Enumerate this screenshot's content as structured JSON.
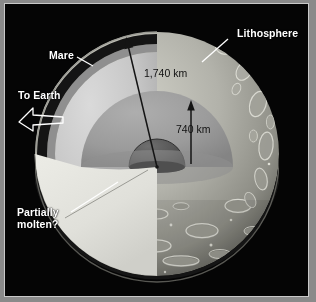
{
  "figure": {
    "background_color": "#050505",
    "frame_color": "#c9c9c9",
    "mount_color": "#8a8a8a"
  },
  "callouts": [
    {
      "id": "lithosphere",
      "label": "Lithosphere",
      "color": "#ffffff",
      "leader": "line-down-left"
    },
    {
      "id": "mare",
      "label": "Mare",
      "color": "#ffffff",
      "leader": "line-down-right"
    },
    {
      "id": "to-earth",
      "label": "To Earth",
      "color": "#ffffff",
      "leader": "hollow-arrow-up-left"
    },
    {
      "id": "partially-molten",
      "label": "Partially\nmolten?",
      "color": "#ffffff",
      "leader": "line-up-right"
    }
  ],
  "dimensions": [
    {
      "id": "outer-radius",
      "label": "1,740 km",
      "color": "#111111",
      "arrow": "diagonal-up-left-from-core"
    },
    {
      "id": "inner-radius",
      "label": "740 km",
      "color": "#111111",
      "arrow": "vertical-up-from-core"
    }
  ],
  "layers": {
    "surface": {
      "name": "cratered-regolith-surface",
      "color": "#a9a9a2"
    },
    "lithosphere": {
      "name": "lithosphere-band",
      "color": "#191919"
    },
    "mare": {
      "name": "mare-band",
      "color": "#8d8d8d"
    },
    "mantle": {
      "name": "mantle",
      "color": "#c8c8c8"
    },
    "asthenosphere": {
      "name": "partially-molten-zone",
      "color": "#9d9d9d"
    },
    "core": {
      "name": "core",
      "color": "#5a5a5a"
    },
    "cut_plane": {
      "name": "cut-plane-surface",
      "color": "#e2e2de"
    }
  }
}
